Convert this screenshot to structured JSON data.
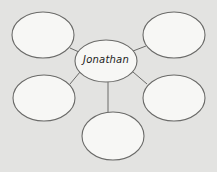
{
  "diagram": {
    "type": "mind-map",
    "center": {
      "label": "Jonathan",
      "cx": 106,
      "cy": 61,
      "rx": 31,
      "ry": 21
    },
    "nodes": [
      {
        "id": "top-left",
        "label": "",
        "cx": 43,
        "cy": 35,
        "rx": 31,
        "ry": 23
      },
      {
        "id": "top-right",
        "label": "",
        "cx": 174,
        "cy": 35,
        "rx": 31,
        "ry": 23
      },
      {
        "id": "mid-left",
        "label": "",
        "cx": 44,
        "cy": 98,
        "rx": 31,
        "ry": 23
      },
      {
        "id": "mid-right",
        "label": "",
        "cx": 174,
        "cy": 98,
        "rx": 31,
        "ry": 23
      },
      {
        "id": "bottom",
        "label": "",
        "cx": 113,
        "cy": 136,
        "rx": 31,
        "ry": 24
      }
    ],
    "colors": {
      "background": "#e3e3e1",
      "fill": "#f7f7f5",
      "stroke": "#6a6a68"
    }
  }
}
